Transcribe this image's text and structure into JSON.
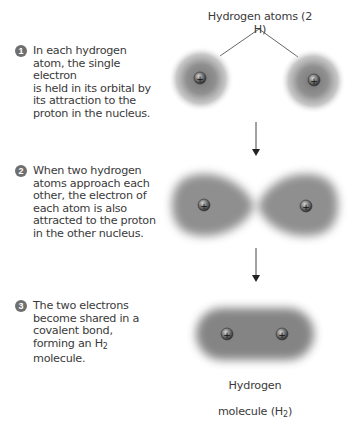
{
  "header": {
    "atoms_label": "Hydrogen atoms (2 H)"
  },
  "steps": [
    {
      "number": "1",
      "text": "In each hydrogen\natom, the single electron\nis held in its orbital by\nits attraction to the\nproton in the nucleus."
    },
    {
      "number": "2",
      "text": "When two hydrogen\natoms approach each\nother, the electron of\neach atom is also\nattracted to the proton\nin the other nucleus."
    },
    {
      "number": "3",
      "text_before": "The two electrons\nbecome shared in a\ncovalent bond,\nforming an H",
      "text_sub": "2",
      "text_after": "\nmolecule."
    }
  ],
  "molecule_label": {
    "line1": "Hydrogen",
    "line2_before": "molecule (H",
    "line2_sub": "2",
    "line2_after": ")"
  },
  "nucleus_symbol": "+",
  "colors": {
    "text": "#3a3a3a",
    "badge": "#6f6f6f",
    "cloud": "#7a7a7a",
    "nucleus": "#4a4a4a",
    "lines": "#555555"
  }
}
